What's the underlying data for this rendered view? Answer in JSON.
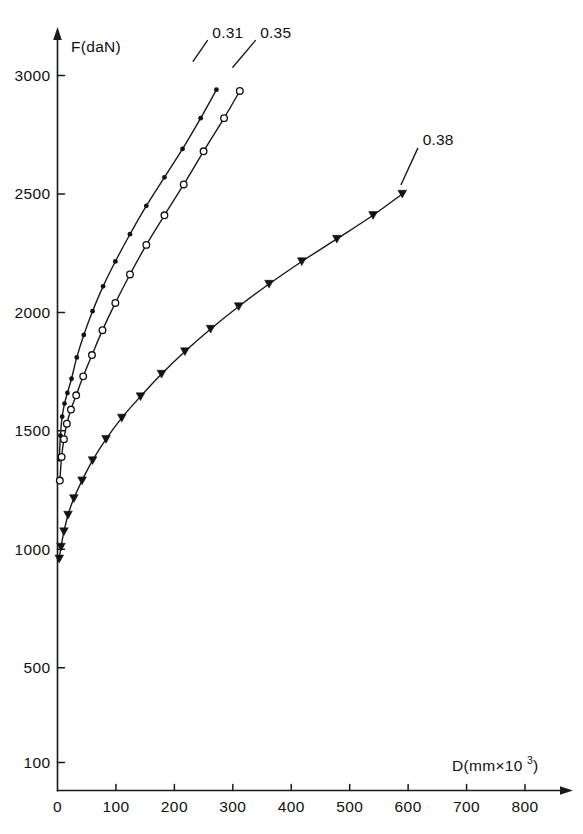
{
  "chart_data": {
    "type": "line",
    "title": "",
    "subtitle": "",
    "xlabel": "D(mm×10³)",
    "xlabel_base": "D(mm×10",
    "xlabel_exp": "3",
    "xlabel_close": ")",
    "ylabel": "F(daN)",
    "xlim": [
      0,
      860
    ],
    "ylim": [
      0,
      3100
    ],
    "grid": false,
    "legend_position": "inline-annotation",
    "x_ticks": [
      0,
      100,
      200,
      300,
      400,
      500,
      600,
      700,
      800
    ],
    "x_tick_labels": [
      "0",
      "100",
      "200",
      "300",
      "400",
      "500",
      "600",
      "700",
      "800"
    ],
    "y_ticks": [
      100,
      500,
      1000,
      1500,
      2000,
      2500,
      3000
    ],
    "y_tick_labels": [
      "100",
      "500",
      "1000",
      "1500",
      "2000",
      "2500",
      "3000"
    ],
    "series": [
      {
        "name": "0.31",
        "label": "0.31",
        "marker": "filled-dot",
        "label_x": 265,
        "label_y": 3160,
        "leader_from_x": 232,
        "leader_from_y": 3060,
        "points_x": [
          3,
          5,
          8,
          12,
          17,
          24,
          33,
          45,
          60,
          78,
          99,
          124,
          152,
          183,
          214,
          245,
          272
        ],
        "points_y": [
          1380,
          1480,
          1560,
          1615,
          1660,
          1720,
          1810,
          1905,
          2005,
          2110,
          2215,
          2330,
          2450,
          2570,
          2690,
          2820,
          2940
        ]
      },
      {
        "name": "0.35",
        "label": "0.35",
        "marker": "open-circle",
        "label_x": 347,
        "label_y": 3160,
        "leader_from_x": 300,
        "leader_from_y": 3035,
        "points_x": [
          4,
          7,
          11,
          16,
          23,
          32,
          44,
          59,
          77,
          99,
          124,
          152,
          183,
          216,
          250,
          285,
          312
        ],
        "points_y": [
          1290,
          1390,
          1465,
          1530,
          1590,
          1650,
          1730,
          1820,
          1925,
          2040,
          2160,
          2285,
          2410,
          2540,
          2680,
          2820,
          2935
        ]
      },
      {
        "name": "0.38",
        "label": "0.38",
        "marker": "filled-triangle",
        "label_x": 625,
        "label_y": 2705,
        "leader_from_x": 588,
        "leader_from_y": 2540,
        "points_x": [
          3,
          6,
          11,
          18,
          28,
          42,
          60,
          83,
          110,
          142,
          178,
          218,
          262,
          310,
          362,
          418,
          478,
          540,
          590
        ],
        "points_y": [
          960,
          1010,
          1075,
          1145,
          1215,
          1290,
          1375,
          1465,
          1555,
          1645,
          1740,
          1835,
          1930,
          2025,
          2120,
          2215,
          2310,
          2410,
          2500
        ]
      }
    ]
  },
  "axes": {
    "y_axis_name": "force-axis",
    "x_axis_name": "displacement-axis"
  }
}
